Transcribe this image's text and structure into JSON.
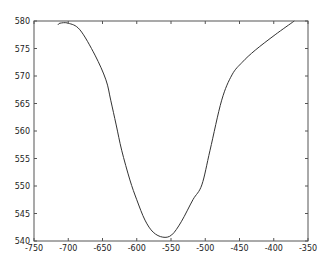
{
  "chart_data": {
    "type": "line",
    "title": "",
    "xlabel": "",
    "ylabel": "",
    "xlim": [
      -750,
      -350
    ],
    "ylim": [
      540,
      580
    ],
    "x_ticks": [
      -750,
      -700,
      -650,
      -600,
      -550,
      -500,
      -450,
      -400,
      -350
    ],
    "y_ticks": [
      540,
      545,
      550,
      555,
      560,
      565,
      570,
      575,
      580
    ],
    "x_tick_labels": [
      "-750",
      "-700",
      "-650",
      "-600",
      "-550",
      "-500",
      "-450",
      "-400",
      "-350"
    ],
    "y_tick_labels": [
      "540",
      "545",
      "550",
      "555",
      "560",
      "565",
      "570",
      "575",
      "580"
    ],
    "grid": false,
    "legend": null,
    "series": [
      {
        "name": "curve",
        "color": "#333333",
        "x": [
          -715,
          -712,
          -700,
          -683,
          -661,
          -645,
          -638,
          -630,
          -622,
          -610,
          -600,
          -588,
          -576,
          -562,
          -549,
          -535,
          -518,
          -505,
          -493,
          -476,
          -461,
          -446,
          -427,
          -398,
          -370
        ],
        "y": [
          579.3,
          579.6,
          579.6,
          578.4,
          573.8,
          569.3,
          565.6,
          561.1,
          556.5,
          551.1,
          547.5,
          543.8,
          541.6,
          540.7,
          541.1,
          543.5,
          547.5,
          550.2,
          556.5,
          565.6,
          570.2,
          572.5,
          574.7,
          577.5,
          580.0
        ]
      }
    ]
  },
  "style": {
    "axis_color": "#555555",
    "line_color": "#333333",
    "background": "#ffffff"
  }
}
